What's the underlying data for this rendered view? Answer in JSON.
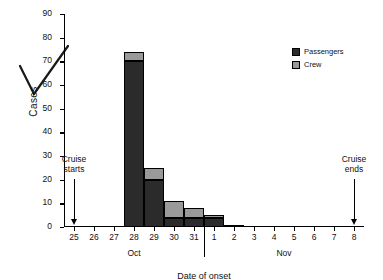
{
  "chart_data": {
    "type": "bar",
    "subtype": "stacked-histogram",
    "title": "",
    "xlabel": "Date of onset",
    "ylabel": "Cases",
    "ylim": [
      0,
      90
    ],
    "ytick_step": 10,
    "yticks": [
      0,
      10,
      20,
      30,
      40,
      50,
      60,
      70,
      80,
      90
    ],
    "grid": false,
    "legend_position": "top-right",
    "categories": [
      "25",
      "26",
      "27",
      "28",
      "29",
      "30",
      "31",
      "1",
      "2",
      "3",
      "4",
      "5",
      "6",
      "7",
      "8"
    ],
    "month_groups": [
      {
        "label": "Oct",
        "start": "25",
        "end": "31"
      },
      {
        "label": "Nov",
        "start": "1",
        "end": "8"
      }
    ],
    "series": [
      {
        "name": "Passengers",
        "color": "#2b2b2b",
        "values": [
          0,
          0,
          0,
          70,
          20,
          4,
          4,
          4,
          1,
          0,
          0,
          0,
          0,
          0,
          0
        ]
      },
      {
        "name": "Crew",
        "color": "#9a9a9a",
        "values": [
          0,
          0,
          0,
          4,
          5,
          7,
          4,
          1,
          0,
          0,
          0,
          0,
          0,
          0,
          0
        ]
      }
    ],
    "totals": [
      0,
      0,
      0,
      74,
      25,
      11,
      8,
      5,
      1,
      0,
      0,
      0,
      0,
      0,
      0
    ],
    "annotations": [
      {
        "name": "cruise-starts",
        "text_line1": "Cruise",
        "text_line2": "starts",
        "at_category": "25"
      },
      {
        "name": "cruise-ends",
        "text_line1": "Cruise",
        "text_line2": "ends",
        "at_category": "8"
      }
    ]
  },
  "legend": {
    "items": [
      {
        "label": "Passengers",
        "color": "#2b2b2b"
      },
      {
        "label": "Crew",
        "color": "#9a9a9a"
      }
    ]
  },
  "axes": {
    "y_title": "Cases",
    "x_title": "Date of onset"
  },
  "marks": {
    "checkmark_icon": "check-mark"
  }
}
